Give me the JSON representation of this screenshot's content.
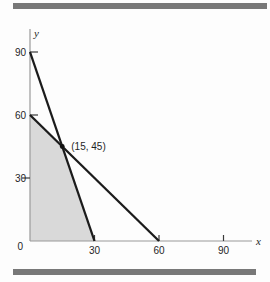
{
  "figure": {
    "top_rule_color": "#787878",
    "bottom_rule_color": "#787878",
    "background": "#fdfdfd"
  },
  "chart_data": {
    "type": "line",
    "title": "",
    "xlabel": "x",
    "ylabel": "y",
    "xlim": [
      0,
      105
    ],
    "ylim": [
      0,
      100
    ],
    "grid": false,
    "x_ticks": [
      30,
      60,
      90
    ],
    "y_ticks": [
      30,
      60,
      90
    ],
    "origin_label": "0",
    "series": [
      {
        "name": "steep-constraint-line",
        "x": [
          0,
          30
        ],
        "y": [
          90,
          0
        ],
        "color": "#1b1b1b"
      },
      {
        "name": "shallow-constraint-line",
        "x": [
          0,
          60
        ],
        "y": [
          60,
          0
        ],
        "color": "#1b1b1b"
      }
    ],
    "shaded_region": {
      "name": "feasible-region",
      "vertices": [
        [
          0,
          0
        ],
        [
          0,
          60
        ],
        [
          15,
          45
        ],
        [
          30,
          0
        ]
      ],
      "fill": "#d9d9d9"
    },
    "annotations": [
      {
        "type": "point",
        "x": 15,
        "y": 45,
        "label": "(15, 45)",
        "marker_color": "#111111"
      }
    ],
    "axis_color": "#9a9a9a",
    "tick_color": "#3a3a3a",
    "text_color": "#1f1f1f"
  }
}
